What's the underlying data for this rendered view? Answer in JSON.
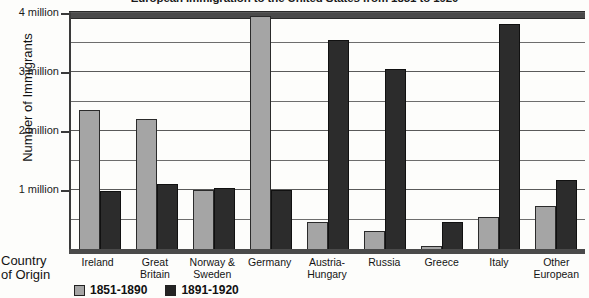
{
  "chart_data": {
    "type": "bar",
    "title": "European Immigration to the United States from 1851 to 1920",
    "xlabel": "Country of Origin",
    "ylabel": "Number of Immigrants",
    "categories": [
      "Ireland",
      "Great Britain",
      "Norway & Sweden",
      "Germany",
      "Austria-Hungary",
      "Russia",
      "Greece",
      "Italy",
      "Other European"
    ],
    "category_lines": [
      [
        "Ireland"
      ],
      [
        "Great",
        "Britain"
      ],
      [
        "Norway &",
        "Sweden"
      ],
      [
        "Germany"
      ],
      [
        "Austria-",
        "Hungary"
      ],
      [
        "Russia"
      ],
      [
        "Greece"
      ],
      [
        "Italy"
      ],
      [
        "Other",
        "European"
      ]
    ],
    "series": [
      {
        "name": "1851-1890",
        "color": "#a5a5a5",
        "values": [
          2.35,
          2.2,
          1.0,
          3.95,
          0.45,
          0.3,
          0.05,
          0.55,
          0.73
        ]
      },
      {
        "name": "1891-1920",
        "color": "#2c2c2c",
        "values": [
          0.98,
          1.1,
          1.03,
          1.0,
          3.55,
          3.05,
          0.45,
          3.82,
          1.17
        ]
      }
    ],
    "ylim": [
      0,
      4
    ],
    "ytick_values": [
      1,
      2,
      3,
      4
    ],
    "ytick_labels": [
      "1 million",
      "2 million",
      "3 million",
      "4 million"
    ],
    "gridline_values": [
      0.5,
      1,
      1.5,
      2,
      2.5,
      3,
      3.5,
      4
    ],
    "grid": true,
    "legend_position": "bottom-left",
    "units": "millions of immigrants"
  },
  "legend": [
    {
      "label": "1851-1890"
    },
    {
      "label": "1891-1920"
    }
  ]
}
